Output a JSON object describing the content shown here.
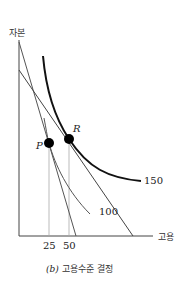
{
  "diagram": {
    "y_axis_label": "자본",
    "x_axis_label": "고용",
    "x_ticks": [
      "25",
      "50"
    ],
    "points": [
      {
        "name": "P",
        "label": "P"
      },
      {
        "name": "R",
        "label": "R"
      }
    ],
    "curves": [
      {
        "name": "isoquant-100",
        "label": "100"
      },
      {
        "name": "isoquant-150",
        "label": "150"
      }
    ],
    "caption_prefix": "(b)",
    "caption": "고용수준 결정",
    "colors": {
      "line": "#333333",
      "guide": "#9a9a9a",
      "background": "#ffffff"
    }
  }
}
